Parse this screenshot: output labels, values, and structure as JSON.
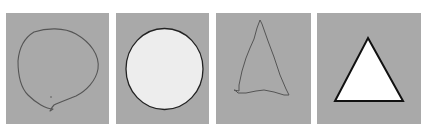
{
  "panels": [
    {
      "id": "sketch-circle",
      "shape": "hand-drawn circle",
      "fill": "none",
      "stroke": "#555555"
    },
    {
      "id": "clean-circle",
      "shape": "circle",
      "fill": "#ededed",
      "stroke": "#222222"
    },
    {
      "id": "sketch-triangle",
      "shape": "hand-drawn triangle",
      "fill": "none",
      "stroke": "#555555"
    },
    {
      "id": "clean-triangle",
      "shape": "triangle",
      "fill": "#ffffff",
      "stroke": "#111111"
    }
  ],
  "colors": {
    "panel_bg": "#a9a9a9",
    "page_bg": "#ffffff"
  }
}
